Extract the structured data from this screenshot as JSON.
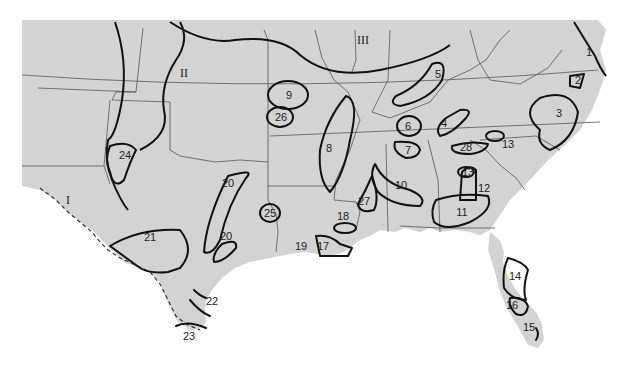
{
  "map": {
    "title": "Southeastern United States climate/zone map",
    "colors": {
      "land": "#d3d3d3",
      "water": "#ffffff",
      "zone_line": "#111111",
      "state_line": "#555555"
    },
    "region_labels": [
      {
        "id": "I",
        "text": "I",
        "x": 68,
        "y": 200
      },
      {
        "id": "II",
        "text": "II",
        "x": 184,
        "y": 73
      },
      {
        "id": "III",
        "text": "III",
        "x": 363,
        "y": 40
      }
    ],
    "zone_labels": [
      {
        "id": "1",
        "text": "1",
        "x": 589,
        "y": 52
      },
      {
        "id": "2",
        "text": "2",
        "x": 578,
        "y": 80
      },
      {
        "id": "3",
        "text": "3",
        "x": 559,
        "y": 113
      },
      {
        "id": "4",
        "text": "4",
        "x": 444,
        "y": 123
      },
      {
        "id": "5",
        "text": "5",
        "x": 438,
        "y": 74
      },
      {
        "id": "6",
        "text": "6",
        "x": 408,
        "y": 126
      },
      {
        "id": "7",
        "text": "7",
        "x": 408,
        "y": 150
      },
      {
        "id": "8",
        "text": "8",
        "x": 329,
        "y": 148
      },
      {
        "id": "9",
        "text": "9",
        "x": 289,
        "y": 95
      },
      {
        "id": "10",
        "text": "10",
        "x": 401,
        "y": 185
      },
      {
        "id": "11",
        "text": "11",
        "x": 462,
        "y": 212
      },
      {
        "id": "12",
        "text": "12",
        "x": 484,
        "y": 188
      },
      {
        "id": "13a",
        "text": "13",
        "x": 468,
        "y": 172
      },
      {
        "id": "13b",
        "text": "13",
        "x": 508,
        "y": 144
      },
      {
        "id": "14",
        "text": "14",
        "x": 515,
        "y": 276
      },
      {
        "id": "15",
        "text": "15",
        "x": 529,
        "y": 327
      },
      {
        "id": "16",
        "text": "16",
        "x": 512,
        "y": 305
      },
      {
        "id": "17",
        "text": "17",
        "x": 323,
        "y": 246
      },
      {
        "id": "18",
        "text": "18",
        "x": 343,
        "y": 216
      },
      {
        "id": "19",
        "text": "19",
        "x": 301,
        "y": 246
      },
      {
        "id": "20a",
        "text": "20",
        "x": 228,
        "y": 183
      },
      {
        "id": "20b",
        "text": "20",
        "x": 226,
        "y": 236
      },
      {
        "id": "21",
        "text": "21",
        "x": 150,
        "y": 237
      },
      {
        "id": "22",
        "text": "22",
        "x": 212,
        "y": 301
      },
      {
        "id": "23",
        "text": "23",
        "x": 189,
        "y": 336
      },
      {
        "id": "24",
        "text": "24",
        "x": 125,
        "y": 155
      },
      {
        "id": "25",
        "text": "25",
        "x": 270,
        "y": 213
      },
      {
        "id": "26",
        "text": "26",
        "x": 281,
        "y": 117
      },
      {
        "id": "27",
        "text": "27",
        "x": 364,
        "y": 201
      },
      {
        "id": "28",
        "text": "28",
        "x": 466,
        "y": 147
      }
    ]
  }
}
